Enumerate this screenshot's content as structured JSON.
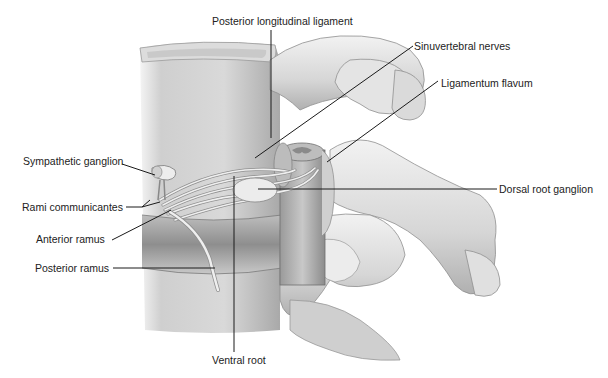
{
  "figure": {
    "labels": [
      {
        "id": "posterior-longitudinal-ligament",
        "text": "Posterior longitudinal ligament"
      },
      {
        "id": "sinuvertebral-nerves",
        "text": "Sinuvertebral nerves"
      },
      {
        "id": "ligamentum-flavum",
        "text": "Ligamentum flavum"
      },
      {
        "id": "sympathetic-ganglion",
        "text": "Sympathetic ganglion"
      },
      {
        "id": "rami-communicantes",
        "text": "Rami communicantes"
      },
      {
        "id": "anterior-ramus",
        "text": "Anterior ramus"
      },
      {
        "id": "posterior-ramus",
        "text": "Posterior ramus"
      },
      {
        "id": "dorsal-root-ganglion",
        "text": "Dorsal root ganglion"
      },
      {
        "id": "ventral-root",
        "text": "Ventral root"
      }
    ]
  },
  "colors": {
    "background": "#ffffff",
    "leader_line": "#1a1a1a",
    "label_text": "#222222",
    "bone_light": "#e6e6e6",
    "bone_mid": "#c4c4c4",
    "bone_dark": "#8a8a8a"
  }
}
